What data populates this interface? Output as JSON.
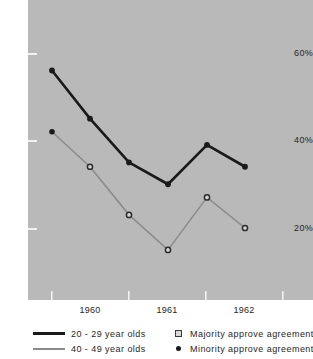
{
  "chart_data": {
    "type": "line",
    "title": "",
    "subtitle": "",
    "xlabel": "",
    "ylabel": "",
    "grid": false,
    "legend_position": "bottom",
    "x": [
      "1959",
      "1960",
      "1960.5",
      "1961",
      "1961.5",
      "1962"
    ],
    "xtick_labels": [
      "1960",
      "1961",
      "1962"
    ],
    "ytick_labels": [
      "60%",
      "40%",
      "20%"
    ],
    "ytick_values": [
      60,
      40,
      20
    ],
    "ylim": [
      8,
      68
    ],
    "series": [
      {
        "name": "20 - 29 year olds",
        "color": "#1a1a1a",
        "marker": "filled-dot",
        "values": [
          56,
          45,
          35,
          30,
          39,
          34
        ]
      },
      {
        "name": "40 - 49 year olds",
        "color": "#8c8c8c",
        "marker": "open-circle",
        "values": [
          42,
          34,
          23,
          15,
          27,
          20
        ]
      }
    ],
    "marker_legend": [
      {
        "name": "Majority approve agreement",
        "marker": "open-circle"
      },
      {
        "name": "Minority approve agreement",
        "marker": "filled-dot"
      }
    ]
  },
  "axes": {
    "yticks": [
      {
        "label": "60%",
        "value": 60
      },
      {
        "label": "40%",
        "value": 40
      },
      {
        "label": "20%",
        "value": 20
      }
    ],
    "xticks": [
      {
        "label": "1960"
      },
      {
        "label": "1961"
      },
      {
        "label": "1962"
      }
    ]
  },
  "legend": {
    "series": [
      {
        "label": "20 - 29 year olds",
        "color": "#1a1a1a"
      },
      {
        "label": "40 - 49 year olds",
        "color": "#8c8c8c"
      }
    ],
    "markers": [
      {
        "label": "Majority approve agreement",
        "icon": "open-circle-icon"
      },
      {
        "label": "Minority approve agreement",
        "icon": "filled-dot-icon"
      }
    ]
  },
  "colors": {
    "panel_background": "#b9b9b9",
    "page_background": "#ffffff",
    "series_young": "#1a1a1a",
    "series_old": "#8c8c8c",
    "tick": "#f2f2f2",
    "text": "#262626"
  }
}
